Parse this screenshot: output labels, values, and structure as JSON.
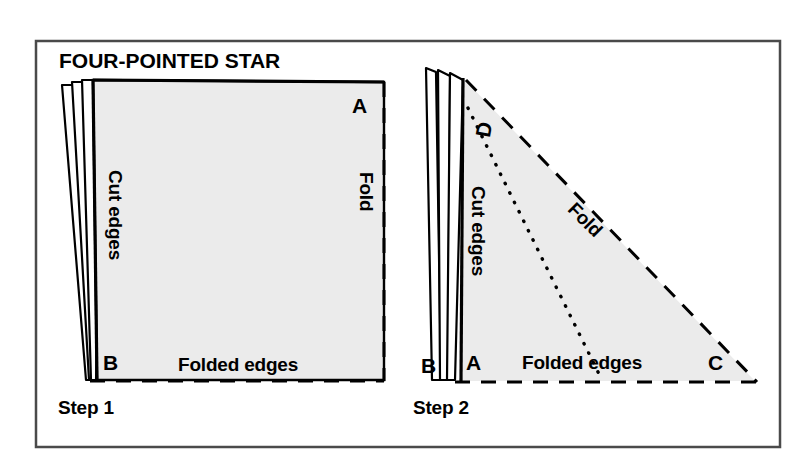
{
  "figure": {
    "title": "FOUR-POINTED STAR",
    "background_color": "#ffffff",
    "frame_color": "#4a4a4a",
    "paper_fill": "#ebebeb",
    "paper_stroke": "#000000",
    "steps": [
      {
        "id": "step-1",
        "caption": "Step 1",
        "shape": "rectangle-stack",
        "labels": {
          "corner_top_right": "A",
          "corner_bottom_left": "B",
          "left_edge": "Cut edges",
          "right_edge": "Fold",
          "bottom_edge": "Folded edges"
        }
      },
      {
        "id": "step-2",
        "caption": "Step 2",
        "shape": "right-triangle-stack",
        "labels": {
          "corner_top_left": "D",
          "corner_bottom_left_outer": "B",
          "corner_bottom_left_inner": "A",
          "corner_bottom_right": "C",
          "left_edge": "Cut edges",
          "hypotenuse": "Fold",
          "bottom_edge": "Folded edges"
        }
      }
    ]
  }
}
